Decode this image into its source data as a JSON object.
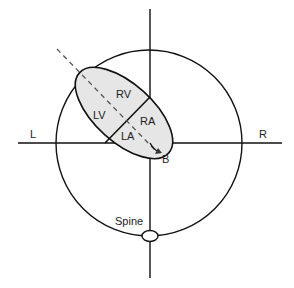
{
  "diagram": {
    "type": "cardiac-axis-cross-section",
    "labels": {
      "left": "L",
      "right": "R",
      "rv": "RV",
      "lv": "LV",
      "ra": "RA",
      "la": "LA",
      "beam": "B",
      "spine": "Spine"
    },
    "colors": {
      "line": "#111111",
      "heart_fill": "#e6e6e6",
      "dashed": "#555555"
    }
  }
}
